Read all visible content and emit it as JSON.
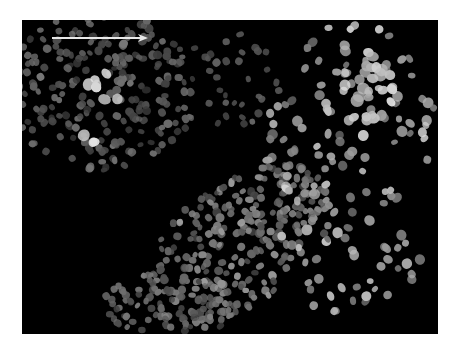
{
  "image": {
    "description": "Grayscale fluorescence micrograph of cell nuclei with a white arrow pointing right",
    "background_color": "#ffffff",
    "field_color": "#000000",
    "field": {
      "x": 22,
      "y": 20,
      "width": 416,
      "height": 314
    }
  },
  "arrow": {
    "x1": 30,
    "y1": 18,
    "x2": 126,
    "y2": 18,
    "color": "#e8e8e8",
    "direction": "right"
  },
  "regions": [
    {
      "name": "dense-upper-left",
      "cx": 80,
      "cy": 70,
      "rx": 95,
      "ry": 80,
      "count": 230,
      "size": [
        3.0,
        4.5
      ],
      "brightness": [
        55,
        120
      ]
    },
    {
      "name": "bright-cluster",
      "cx": 80,
      "cy": 90,
      "rx": 25,
      "ry": 45,
      "count": 10,
      "size": [
        4.5,
        6.5
      ],
      "brightness": [
        190,
        240
      ]
    },
    {
      "name": "diagonal-band",
      "cx": 215,
      "cy": 225,
      "rx": 110,
      "ry": 60,
      "rot": -35,
      "count": 260,
      "size": [
        3.0,
        4.5
      ],
      "brightness": [
        70,
        160
      ]
    },
    {
      "name": "lower-band",
      "cx": 150,
      "cy": 285,
      "rx": 70,
      "ry": 30,
      "count": 90,
      "size": [
        3.0,
        4.2
      ],
      "brightness": [
        60,
        130
      ]
    },
    {
      "name": "sparse-right",
      "cx": 330,
      "cy": 150,
      "rx": 90,
      "ry": 150,
      "count": 140,
      "size": [
        3.2,
        5.5
      ],
      "brightness": [
        110,
        215
      ]
    },
    {
      "name": "upper-right-bright",
      "cx": 340,
      "cy": 70,
      "rx": 40,
      "ry": 50,
      "count": 30,
      "size": [
        4.0,
        6.5
      ],
      "brightness": [
        170,
        230
      ]
    },
    {
      "name": "mid-top-sparse",
      "cx": 200,
      "cy": 60,
      "rx": 60,
      "ry": 50,
      "count": 40,
      "size": [
        3.0,
        4.2
      ],
      "brightness": [
        60,
        110
      ]
    }
  ]
}
